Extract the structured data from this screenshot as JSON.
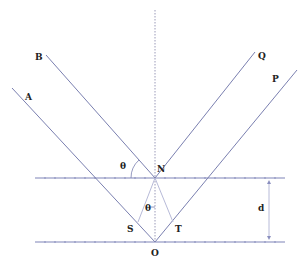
{
  "diagram": {
    "colors": {
      "ray": "#7a7fb0",
      "surface": "#7f84b8",
      "label": "#222222",
      "background": "#ffffff"
    },
    "labels": {
      "A": "A",
      "B": "B",
      "P": "P",
      "Q": "Q",
      "N": "N",
      "O": "O",
      "S": "S",
      "T": "T",
      "d": "d",
      "theta_top": "θ",
      "theta_inner": "θ"
    },
    "points": {
      "A_start": [
        12,
        88
      ],
      "B_start": [
        46,
        55
      ],
      "N": [
        155,
        178
      ],
      "O": [
        155,
        242
      ],
      "Q_end": [
        255,
        52
      ],
      "P_end": [
        297,
        70
      ],
      "S_end": [
        138,
        222
      ],
      "T_end": [
        173,
        222
      ]
    },
    "surfaces": {
      "top_y": 178,
      "bottom_y": 242,
      "x_start": 35,
      "x_end": 285
    },
    "normal": {
      "x": 155,
      "y_start": 10,
      "y_end": 240
    },
    "separation": {
      "label": "d",
      "x": 269,
      "y_start": 180,
      "y_end": 240
    }
  }
}
